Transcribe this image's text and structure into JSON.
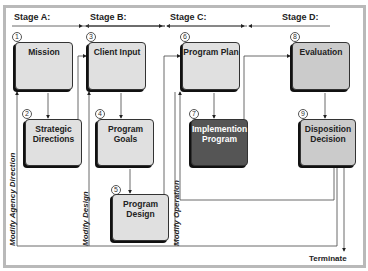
{
  "stages": [
    {
      "id": "A",
      "label": "Stage A:"
    },
    {
      "id": "B",
      "label": "Stage B:"
    },
    {
      "id": "C",
      "label": "Stage C:"
    },
    {
      "id": "D",
      "label": "Stage D:"
    }
  ],
  "boxes": [
    {
      "num": "1",
      "label": "Mission",
      "shade": "light"
    },
    {
      "num": "2",
      "label": "Strategic Directions",
      "shade": "light"
    },
    {
      "num": "3",
      "label": "Client Input",
      "shade": "light"
    },
    {
      "num": "4",
      "label": "Program Goals",
      "shade": "light"
    },
    {
      "num": "5",
      "label": "Program Design",
      "shade": "light"
    },
    {
      "num": "6",
      "label": "Program Plan",
      "shade": "light"
    },
    {
      "num": "7",
      "label": "Implemention Program",
      "shade": "dark"
    },
    {
      "num": "8",
      "label": "Evaluation",
      "shade": "mid"
    },
    {
      "num": "9",
      "label": "Disposition Decision",
      "shade": "mid"
    }
  ],
  "feedback_labels": [
    "Modify Agency Direction",
    "Modify Design",
    "Modify Operation"
  ],
  "terminate_label": "Terminate",
  "colors": {
    "light": "#e0e0e0",
    "mid": "#cbcbcb",
    "dark": "#555555",
    "frame": "#b9b9b9"
  }
}
